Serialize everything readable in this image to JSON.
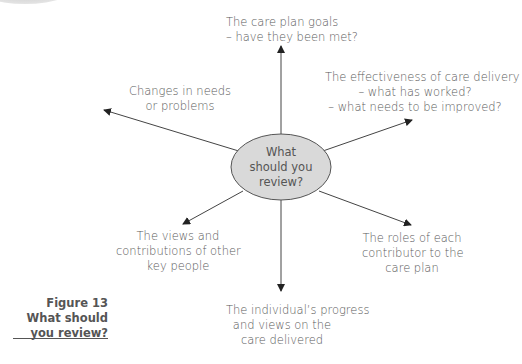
{
  "diagram": {
    "type": "radial-mind-map",
    "center": {
      "lines": [
        "What",
        "should you",
        "review?"
      ],
      "fill": "#d9d9d9",
      "stroke": "#555555"
    },
    "nodes": [
      {
        "id": "top",
        "lines": [
          "The care plan goals",
          "– have they been met?"
        ]
      },
      {
        "id": "upper-right",
        "lines": [
          "The effectiveness of care delivery",
          "– what has worked?",
          "– what needs to be improved?"
        ]
      },
      {
        "id": "upper-left",
        "lines": [
          "Changes in needs",
          "or problems"
        ]
      },
      {
        "id": "lower-left",
        "lines": [
          "The views and",
          "contributions of other",
          "key people"
        ]
      },
      {
        "id": "lower-right",
        "lines": [
          "The roles of each",
          "contributor to the",
          "care plan"
        ]
      },
      {
        "id": "bottom",
        "lines": [
          "The individual’s progress",
          "and views on the",
          "care delivered"
        ]
      }
    ],
    "arrow_color": "#222222"
  },
  "caption": {
    "lines": [
      "Figure 13",
      "What should",
      "you review?"
    ]
  }
}
